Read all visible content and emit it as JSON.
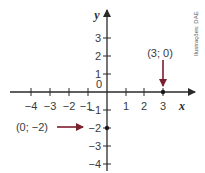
{
  "diagram": {
    "type": "cartesian-plane",
    "axes": {
      "x_label": "x",
      "y_label": "y",
      "origin_label": "0",
      "x_ticks": [
        "−4",
        "−3",
        "−2",
        "−1",
        "1",
        "2",
        "3"
      ],
      "y_ticks": [
        "3",
        "2",
        "1",
        "−1",
        "−2",
        "−3",
        "−4"
      ]
    },
    "points": [
      {
        "label": "(3; 0)",
        "x": 3,
        "y": 0,
        "arrow_direction": "down"
      },
      {
        "label": "(0; −2)",
        "x": 0,
        "y": -2,
        "arrow_direction": "right"
      }
    ],
    "credit": "Ilustrações: DAE",
    "colors": {
      "axis": "#2a2a2a",
      "arrow": "#7a1f2e",
      "point": "#1a1a1a"
    }
  }
}
